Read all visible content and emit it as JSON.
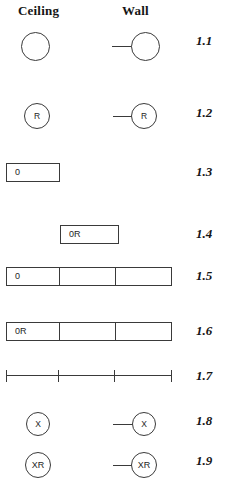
{
  "headers": {
    "ceiling": "Ceiling",
    "wall": "Wall"
  },
  "colors": {
    "stroke": "#3a3a3a",
    "text": "#151515",
    "background": "#ffffff"
  },
  "rows": [
    {
      "number": "1.1",
      "ceiling_label": "",
      "wall_label": "",
      "type": "circle"
    },
    {
      "number": "1.2",
      "ceiling_label": "R",
      "wall_label": "R",
      "type": "circle"
    },
    {
      "number": "1.3",
      "ceiling_label": "0",
      "wall_label": "",
      "type": "bar-1"
    },
    {
      "number": "1.4",
      "ceiling_label": "",
      "wall_label": "0R",
      "type": "bar-1"
    },
    {
      "number": "1.5",
      "ceiling_label": "0",
      "wall_label": "",
      "type": "bar-3"
    },
    {
      "number": "1.6",
      "ceiling_label": "0R",
      "wall_label": "",
      "type": "bar-3"
    },
    {
      "number": "1.7",
      "ceiling_label": "",
      "wall_label": "",
      "type": "axis"
    },
    {
      "number": "1.8",
      "ceiling_label": "X",
      "wall_label": "X",
      "type": "circle"
    },
    {
      "number": "1.9",
      "ceiling_label": "XR",
      "wall_label": "XR",
      "type": "circle"
    }
  ]
}
